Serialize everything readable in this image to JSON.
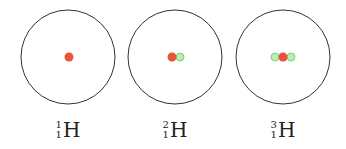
{
  "colors": {
    "proton": "#e8533a",
    "neutron": "#9be39b",
    "neutron_stroke": "#5fbf5f",
    "orbit": "#333333"
  },
  "isotopes": [
    {
      "mass": "1",
      "atomic": "1",
      "symbol": "H",
      "protons": 1,
      "neutrons": 0
    },
    {
      "mass": "2",
      "atomic": "1",
      "symbol": "H",
      "protons": 1,
      "neutrons": 1
    },
    {
      "mass": "3",
      "atomic": "1",
      "symbol": "H",
      "protons": 1,
      "neutrons": 2
    }
  ]
}
